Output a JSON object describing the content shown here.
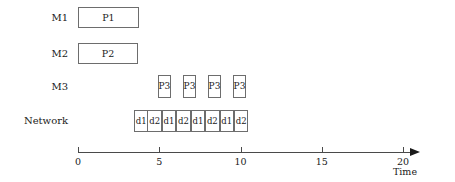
{
  "chart_data": {
    "type": "gantt",
    "title": "",
    "xlabel": "Time",
    "ylabel": "",
    "xlim": [
      0,
      20
    ],
    "xticks": [
      0,
      5,
      10,
      15,
      20
    ],
    "xtick_labels": [
      "0",
      "5",
      "10",
      "15",
      "20"
    ],
    "grid": false,
    "legend": "none",
    "rows": [
      {
        "label": "M1",
        "tasks": [
          {
            "name": "P1",
            "start": 0.0,
            "end": 3.75
          }
        ]
      },
      {
        "label": "M2",
        "tasks": [
          {
            "name": "P2",
            "start": 0.0,
            "end": 3.7
          }
        ]
      },
      {
        "label": "M3",
        "tasks": [
          {
            "name": "P3",
            "start": 4.92,
            "end": 5.72
          },
          {
            "name": "P3",
            "start": 6.46,
            "end": 7.26
          },
          {
            "name": "P3",
            "start": 8.0,
            "end": 8.8
          },
          {
            "name": "P3",
            "start": 9.54,
            "end": 10.34
          }
        ]
      },
      {
        "label": "Network",
        "tasks": [
          {
            "name": "d1",
            "start": 3.45,
            "end": 4.33
          },
          {
            "name": "d2",
            "start": 4.33,
            "end": 5.22
          },
          {
            "name": "d1",
            "start": 5.22,
            "end": 6.11
          },
          {
            "name": "d2",
            "start": 6.11,
            "end": 7.0
          },
          {
            "name": "d1",
            "start": 7.0,
            "end": 7.88
          },
          {
            "name": "d2",
            "start": 7.88,
            "end": 8.77
          },
          {
            "name": "d1",
            "start": 8.77,
            "end": 9.66
          },
          {
            "name": "d2",
            "start": 9.66,
            "end": 10.54
          }
        ]
      }
    ]
  },
  "axis": {
    "title": "Time",
    "ticks": [
      "0",
      "5",
      "10",
      "15",
      "20"
    ]
  },
  "labels": {
    "m1": "M1",
    "m2": "M2",
    "m3": "M3",
    "network": "Network"
  },
  "colors": {
    "box_border": "#6d6d6d",
    "axis": "#4a4a4a",
    "text": "#1a1a1a",
    "background": "#ffffff"
  }
}
